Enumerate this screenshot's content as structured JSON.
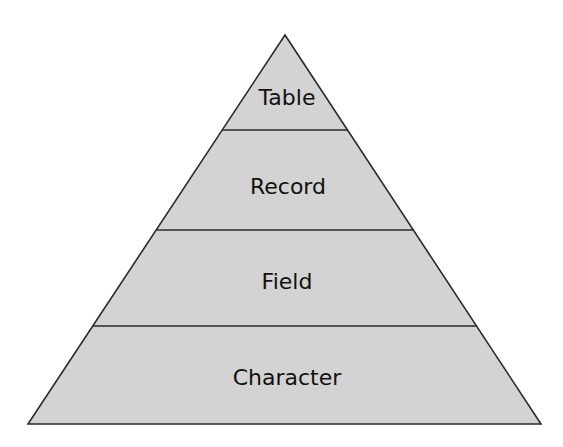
{
  "diagram": {
    "type": "pyramid",
    "title": "",
    "levels": [
      {
        "label": "Table"
      },
      {
        "label": "Record"
      },
      {
        "label": "Field"
      },
      {
        "label": "Character"
      }
    ]
  },
  "colors": {
    "fill": "#d3d3d3",
    "stroke": "#2a2a2a",
    "text": "#111111",
    "background": "#ffffff"
  }
}
